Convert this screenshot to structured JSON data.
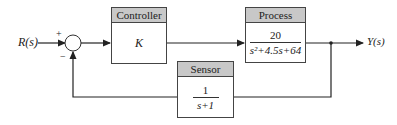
{
  "input_label": "R(s)",
  "output_label": "Y(s)",
  "summing_junction": {
    "plus_sign": "+",
    "minus_sign": "−"
  },
  "controller": {
    "title": "Controller",
    "transfer": "K"
  },
  "process": {
    "title": "Process",
    "numerator": "20",
    "denominator": "s²+4.5s+64"
  },
  "sensor": {
    "title": "Sensor",
    "numerator": "1",
    "denominator": "s+1"
  }
}
